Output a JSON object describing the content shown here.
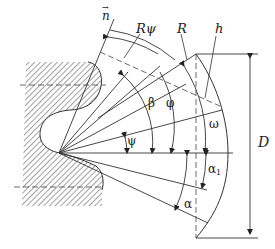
{
  "diagram": {
    "type": "geometric cutting-tool diagram",
    "labels": {
      "n_vector": "n",
      "R_psi": "Rψ",
      "R": "R",
      "h": "h",
      "D": "D",
      "beta": "β",
      "phi": "φ",
      "omega": "ω",
      "psi": "ψ",
      "alpha": "α",
      "alpha1_base": "α",
      "alpha1_sub": "1"
    },
    "colors": {
      "stroke": "#333333",
      "hatch": "#444444",
      "background": "#ffffff"
    }
  }
}
